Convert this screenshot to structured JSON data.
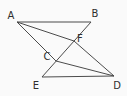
{
  "diagram": {
    "background_color": "#fafafa",
    "line_color": "#4b4b4b",
    "label_color": "#2e2e2e",
    "points": [
      {
        "label": "A",
        "x": 17,
        "y": 22,
        "label_x": 11,
        "label_y": 19
      },
      {
        "label": "B",
        "x": 91,
        "y": 22,
        "label_x": 95,
        "label_y": 17
      },
      {
        "label": "F",
        "x": 74,
        "y": 41,
        "label_x": 80,
        "label_y": 42
      },
      {
        "label": "C",
        "x": 56,
        "y": 61,
        "label_x": 47,
        "label_y": 60
      },
      {
        "label": "E",
        "x": 42,
        "y": 77,
        "label_x": 36,
        "label_y": 89
      },
      {
        "label": "D",
        "x": 114,
        "y": 76,
        "label_x": 117,
        "label_y": 89
      }
    ],
    "segments": [
      {
        "from": "A",
        "to": "B"
      },
      {
        "from": "B",
        "to": "E"
      },
      {
        "from": "E",
        "to": "D"
      },
      {
        "from": "A",
        "to": "F"
      },
      {
        "from": "F",
        "to": "D"
      },
      {
        "from": "A",
        "to": "C"
      },
      {
        "from": "C",
        "to": "D"
      }
    ]
  }
}
